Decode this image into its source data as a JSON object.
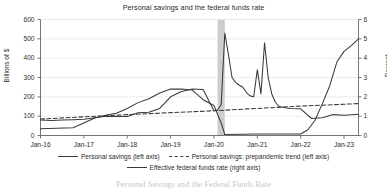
{
  "chart_data": {
    "type": "line",
    "title": "Personal savings and the federal funds rate",
    "xlabel": "",
    "ylabel": "Billions of $",
    "ylabel_right": "Percent",
    "ylim": [
      0,
      600
    ],
    "ylim_right": [
      0,
      6
    ],
    "grid": true,
    "legend_position": "bottom",
    "xtick_labels": [
      "Jan-16",
      "Jan-17",
      "Jan-18",
      "Jan-19",
      "Jan-20",
      "Jan-21",
      "Jan-22",
      "Jan-23"
    ],
    "ytick_labels_left": [
      "0",
      "100",
      "200",
      "300",
      "400",
      "500",
      "600"
    ],
    "ytick_labels_right": [
      "0",
      "1",
      "2",
      "3",
      "4",
      "5",
      "6"
    ],
    "ytick_values_left": [
      0,
      100,
      200,
      300,
      400,
      500,
      600
    ],
    "ytick_values_right": [
      0,
      1,
      2,
      3,
      4,
      5,
      6
    ],
    "x_start": "2016-01",
    "x_end": "2023-05",
    "shaded_regions": [
      {
        "label": "recession",
        "x_start": "2020-02",
        "x_end": "2020-04",
        "color": "#c4c4c4"
      }
    ],
    "series": [
      {
        "name": "Personal savings (left axis)",
        "axis": "left",
        "style": "solid",
        "color": "#3a3a3a",
        "x": [
          "2016-01",
          "2016-04",
          "2016-07",
          "2016-10",
          "2017-01",
          "2017-04",
          "2017-07",
          "2017-10",
          "2018-01",
          "2018-04",
          "2018-07",
          "2018-10",
          "2019-01",
          "2019-04",
          "2019-07",
          "2019-10",
          "2020-01",
          "2020-02",
          "2020-03",
          "2020-04",
          "2020-05",
          "2020-06",
          "2020-07",
          "2020-08",
          "2020-09",
          "2020-10",
          "2020-11",
          "2020-12",
          "2021-01",
          "2021-02",
          "2021-03",
          "2021-04",
          "2021-05",
          "2021-06",
          "2021-07",
          "2021-10",
          "2022-01",
          "2022-04",
          "2022-07",
          "2022-10",
          "2023-01",
          "2023-05"
        ],
        "values": [
          80,
          78,
          80,
          82,
          84,
          92,
          100,
          98,
          98,
          118,
          120,
          140,
          200,
          228,
          240,
          238,
          128,
          132,
          160,
          530,
          420,
          300,
          275,
          260,
          250,
          222,
          205,
          200,
          340,
          215,
          480,
          300,
          215,
          172,
          150,
          140,
          138,
          88,
          92,
          108,
          105,
          110
        ]
      },
      {
        "name": "Personal savings: prepandemic trend (left axis)",
        "axis": "left",
        "style": "dashed",
        "color": "#3a3a3a",
        "x": [
          "2016-01",
          "2018-01",
          "2020-01",
          "2021-01",
          "2022-01",
          "2023-05"
        ],
        "values": [
          85,
          108,
          128,
          140,
          152,
          165
        ]
      },
      {
        "name": "Effective federal funds rate (right axis)",
        "axis": "right",
        "style": "solid",
        "color": "#3a3a3a",
        "x": [
          "2016-01",
          "2016-10",
          "2017-01",
          "2017-04",
          "2017-07",
          "2017-10",
          "2018-01",
          "2018-04",
          "2018-07",
          "2018-10",
          "2019-01",
          "2019-04",
          "2019-07",
          "2019-10",
          "2020-01",
          "2020-03",
          "2020-04",
          "2021-01",
          "2022-01",
          "2022-03",
          "2022-05",
          "2022-07",
          "2022-09",
          "2022-11",
          "2023-01",
          "2023-03",
          "2023-05"
        ],
        "values": [
          0.35,
          0.4,
          0.65,
          0.9,
          1.05,
          1.15,
          1.4,
          1.7,
          1.9,
          2.2,
          2.4,
          2.4,
          2.35,
          1.85,
          1.55,
          0.65,
          0.05,
          0.08,
          0.08,
          0.3,
          0.8,
          1.65,
          2.55,
          3.8,
          4.35,
          4.65,
          5.0
        ]
      }
    ],
    "annotations": []
  },
  "caption": "Personal Savings and the Federal Funds Rate"
}
